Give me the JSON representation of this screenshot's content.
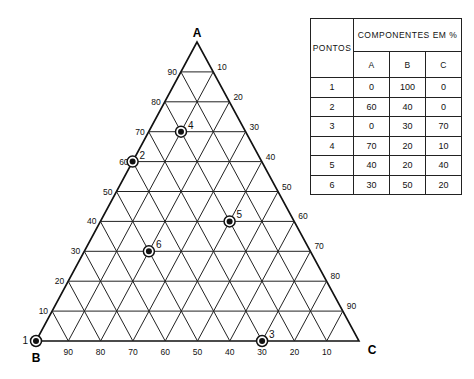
{
  "vertices": {
    "A": "A",
    "B": "B",
    "C": "C"
  },
  "geometry": {
    "A": [
      197,
      42
    ],
    "B": [
      36,
      341
    ],
    "C": [
      359,
      341
    ]
  },
  "ticks": {
    "left_A": [
      "10",
      "20",
      "30",
      "40",
      "50",
      "60",
      "70",
      "80",
      "90"
    ],
    "right_C": [
      "10",
      "20",
      "30",
      "40",
      "50",
      "60",
      "70",
      "80",
      "90"
    ],
    "bottom_B": [
      "90",
      "80",
      "70",
      "60",
      "50",
      "40",
      "30",
      "20",
      "10"
    ]
  },
  "table": {
    "header_pontos": "PONTOS",
    "header_componentes": "COMPONENTES EM %",
    "columns": [
      "A",
      "B",
      "C"
    ],
    "rows": [
      {
        "ponto": "1",
        "A": "0",
        "B": "100",
        "C": "0"
      },
      {
        "ponto": "2",
        "A": "60",
        "B": "40",
        "C": "0"
      },
      {
        "ponto": "3",
        "A": "0",
        "B": "30",
        "C": "70"
      },
      {
        "ponto": "4",
        "A": "70",
        "B": "20",
        "C": "10"
      },
      {
        "ponto": "5",
        "A": "40",
        "B": "20",
        "C": "40"
      },
      {
        "ponto": "6",
        "A": "30",
        "B": "50",
        "C": "20"
      }
    ]
  },
  "points": [
    {
      "label": "1",
      "A": 0,
      "B": 100,
      "C": 0
    },
    {
      "label": "2",
      "A": 60,
      "B": 40,
      "C": 0
    },
    {
      "label": "3",
      "A": 0,
      "B": 30,
      "C": 70
    },
    {
      "label": "4",
      "A": 70,
      "B": 20,
      "C": 10
    },
    {
      "label": "5",
      "A": 40,
      "B": 20,
      "C": 40
    },
    {
      "label": "6",
      "A": 30,
      "B": 50,
      "C": 20
    }
  ]
}
